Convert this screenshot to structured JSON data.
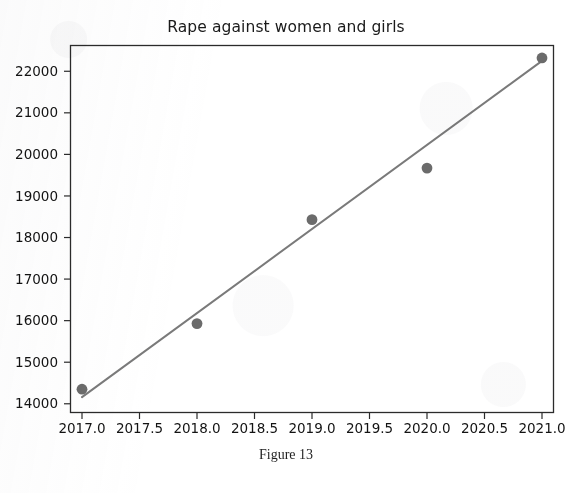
{
  "figure": {
    "title": "Rape against women and girls",
    "caption": "Figure 13"
  },
  "colors": {
    "marker": "#6b6b6b",
    "trendline": "#7a7a7a",
    "axis": "#2b2b2b",
    "text": "#131313",
    "background": "#ffffff"
  },
  "chart_data": {
    "type": "scatter",
    "title": "Rape against women and girls",
    "xlabel": "",
    "ylabel": "",
    "x": [
      2017,
      2018,
      2019,
      2020,
      2021
    ],
    "values": [
      14350,
      15930,
      18430,
      19670,
      22320
    ],
    "series": [
      {
        "name": "Rape against women and girls",
        "type": "scatter",
        "x": [
          2017,
          2018,
          2019,
          2020,
          2021
        ],
        "values": [
          14350,
          15930,
          18430,
          19670,
          22320
        ]
      },
      {
        "name": "Trend line",
        "type": "line",
        "x": [
          2017,
          2021
        ],
        "values": [
          14160,
          22250
        ]
      }
    ],
    "xlim": [
      2016.9,
      2021.1
    ],
    "ylim": [
      13790,
      22620
    ],
    "xticks": [
      2017.0,
      2017.5,
      2018.0,
      2018.5,
      2019.0,
      2019.5,
      2020.0,
      2020.5,
      2021.0
    ],
    "xtick_labels": [
      "2017.0",
      "2017.5",
      "2018.0",
      "2018.5",
      "2019.0",
      "2019.5",
      "2020.0",
      "2020.5",
      "2021.0"
    ],
    "yticks": [
      14000,
      15000,
      16000,
      17000,
      18000,
      19000,
      20000,
      21000,
      22000
    ],
    "ytick_labels": [
      "14000",
      "15000",
      "16000",
      "17000",
      "18000",
      "19000",
      "20000",
      "21000",
      "22000"
    ],
    "grid": false,
    "legend": null,
    "legend_position": "none"
  }
}
